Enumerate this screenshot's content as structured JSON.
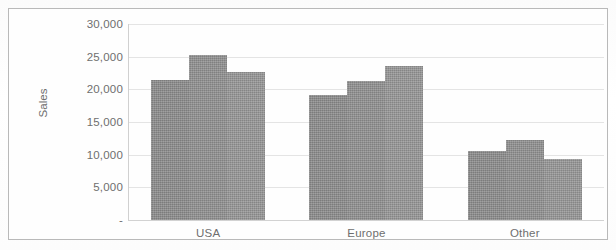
{
  "chart_data": {
    "type": "bar",
    "title": "",
    "subtitle": "",
    "xlabel": "",
    "ylabel": "Sales",
    "categories": [
      "USA",
      "Europe",
      "Other"
    ],
    "series": [
      {
        "name": "Series 1",
        "values": [
          21500,
          19200,
          10600
        ],
        "color": "#8b8b8b"
      },
      {
        "name": "Series 2",
        "values": [
          25200,
          21300,
          12200
        ],
        "color": "#8f8f8f"
      },
      {
        "name": "Series 3",
        "values": [
          22700,
          23500,
          9400
        ],
        "color": "#959595"
      }
    ],
    "ylim": [
      0,
      30000
    ],
    "ytick_values": [
      30000,
      25000,
      20000,
      15000,
      10000,
      5000,
      0
    ],
    "ytick_labels": [
      "30,000",
      "25,000",
      "20,000",
      "15,000",
      "10,000",
      "5,000",
      "-"
    ],
    "grid": true,
    "gridlines": "horizontal",
    "legend": false,
    "legend_position": "none",
    "plot_border": true,
    "background_color": "#ffffff",
    "grid_color": "#e4e4e4",
    "border_color": "#b9b9b9",
    "tick_label_color": "#6e6e6e"
  }
}
